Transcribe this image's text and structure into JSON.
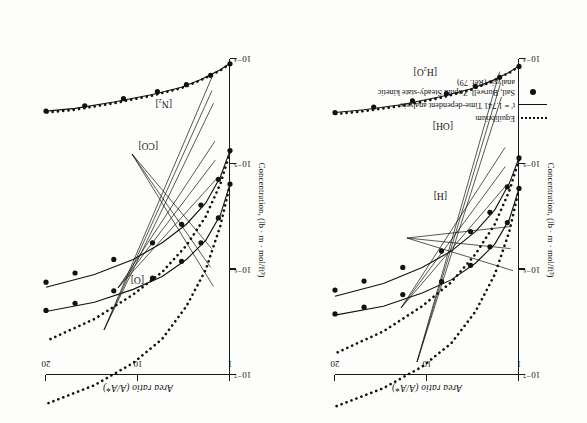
{
  "figure": {
    "orientation_note": "rotated-180",
    "axis_top_title": "Area ratio (A/A*)",
    "axis_side_title": "Concentration, (lb · m · mol/ft³)",
    "area_ticks": [
      "1",
      "10",
      "20"
    ],
    "conc_ticks": [
      "10⁻⁷",
      "10⁻⁶",
      "10⁻⁵",
      "10⁻⁴"
    ]
  },
  "legend": {
    "items": [
      {
        "key": "dotted-line",
        "label": "Equilibrium"
      },
      {
        "key": "solid-line",
        "label": "t' = 1.741 Time-dependent analysis"
      },
      {
        "key": "dot-marker",
        "label": "Satl, Burwell, Zupnik Steady-state kinetic analysis (Ref. 79)"
      }
    ]
  },
  "panels": [
    {
      "id": "left",
      "species_labels": [
        "[H]",
        "[OH]",
        "[H₂O]"
      ]
    },
    {
      "id": "right",
      "species_labels": [
        "[O]",
        "[CO]",
        "[N₂]"
      ]
    }
  ],
  "chart_data": {
    "type": "line",
    "xlabel": "Area ratio (A/A*)",
    "ylabel": "Concentration, (lb · m · mol/ft³)",
    "xlim": [
      1,
      20
    ],
    "xticks": [
      1,
      10,
      20
    ],
    "ylim": [
      1e-07,
      0.0001
    ],
    "yscale": "log",
    "yticks": [
      1e-07,
      1e-06,
      1e-05,
      0.0001
    ],
    "grid": false,
    "legend_position": "lower-left",
    "panels": [
      {
        "panel": "left",
        "series": [
          {
            "name": "[H₂O] equilibrium",
            "style": "dotted",
            "x": [
              1,
              2,
              4,
              6,
              9,
              13,
              17,
              20
            ],
            "y": [
              8.5e-05,
              7.4e-05,
              6e-05,
              5.1e-05,
              4.3e-05,
              3.6e-05,
              3.2e-05,
              3e-05
            ]
          },
          {
            "name": "[H₂O] time-dependent",
            "style": "solid",
            "x": [
              1,
              2,
              4,
              6,
              9,
              13,
              17,
              20
            ],
            "y": [
              8.6e-05,
              7.5e-05,
              6.1e-05,
              5.2e-05,
              4.4e-05,
              3.7e-05,
              3.3e-05,
              3.1e-05
            ]
          },
          {
            "name": "[H₂O] steady-state kinetic (Ref. 79)",
            "style": "markers",
            "x": [
              1,
              3,
              5.5,
              8.5,
              12,
              16,
              20
            ],
            "y": [
              8.5e-05,
              6.7e-05,
              5.5e-05,
              4.7e-05,
              4e-05,
              3.5e-05,
              3.1e-05
            ]
          },
          {
            "name": "[OH] equilibrium",
            "style": "dotted",
            "x": [
              1,
              2,
              3.5,
              5.5,
              8,
              11,
              15,
              20
            ],
            "y": [
              1.1e-05,
              5.6e-06,
              2.7e-06,
              1.4e-06,
              7.6e-07,
              4.5e-07,
              2.6e-07,
              1.6e-07
            ]
          },
          {
            "name": "[OH] time-dependent",
            "style": "solid",
            "x": [
              1,
              2,
              3.5,
              5.5,
              8,
              11,
              15,
              20
            ],
            "y": [
              1.15e-05,
              6.6e-06,
              3.7e-06,
              2.3e-06,
              1.5e-06,
              1.05e-06,
              7.4e-07,
              5.6e-07
            ]
          },
          {
            "name": "[OH] steady-state kinetic (Ref. 79)",
            "style": "markers",
            "x": [
              1,
              2.2,
              4,
              6,
              9,
              13,
              17,
              20
            ],
            "y": [
              1.15e-05,
              6.1e-06,
              3.5e-06,
              2.3e-06,
              1.5e-06,
              1.05e-06,
              7.8e-07,
              6.4e-07
            ]
          },
          {
            "name": "[H] equilibrium",
            "style": "dotted",
            "x": [
              1,
              2,
              3.5,
              5.5,
              8,
              11,
              15,
              20
            ],
            "y": [
              5.8e-06,
              2.3e-06,
              9e-07,
              4e-07,
              2e-07,
              1.2e-07,
              7.5e-08,
              5e-08
            ]
          },
          {
            "name": "[H] time-dependent",
            "style": "solid",
            "x": [
              1,
              2,
              3.5,
              5.5,
              8,
              11,
              15,
              20
            ],
            "y": [
              5.9e-06,
              3e-06,
              1.75e-06,
              1.15e-06,
              8e-07,
              6e-07,
              4.5e-07,
              3.7e-07
            ]
          },
          {
            "name": "[H] steady-state kinetic (Ref. 79)",
            "style": "markers",
            "x": [
              1,
              2.2,
              4,
              6,
              9,
              13,
              17,
              20
            ],
            "y": [
              5.9e-06,
              2.8e-06,
              1.65e-06,
              1.1e-06,
              7.7e-07,
              5.8e-07,
              4.4e-07,
              3.8e-07
            ]
          }
        ]
      },
      {
        "panel": "right",
        "series": [
          {
            "name": "[N₂] equilibrium",
            "style": "dotted",
            "x": [
              1,
              2,
              4,
              6,
              9,
              13,
              17,
              20
            ],
            "y": [
              9e-05,
              7.8e-05,
              6.3e-05,
              5.3e-05,
              4.5e-05,
              3.8e-05,
              3.3e-05,
              3.1e-05
            ]
          },
          {
            "name": "[N₂] time-dependent",
            "style": "solid",
            "x": [
              1,
              2,
              4,
              6,
              9,
              13,
              17,
              20
            ],
            "y": [
              9.1e-05,
              7.9e-05,
              6.4e-05,
              5.4e-05,
              4.6e-05,
              3.9e-05,
              3.4e-05,
              3.2e-05
            ]
          },
          {
            "name": "[N₂] steady-state kinetic (Ref. 79)",
            "style": "markers",
            "x": [
              1,
              3,
              5.5,
              8.5,
              12,
              16,
              20
            ],
            "y": [
              9e-05,
              7e-05,
              5.7e-05,
              4.9e-05,
              4.2e-05,
              3.6e-05,
              3.2e-05
            ]
          },
          {
            "name": "[CO] equilibrium",
            "style": "dotted",
            "x": [
              1,
              2,
              3.5,
              5.5,
              8,
              11,
              15,
              20
            ],
            "y": [
              1.3e-05,
              6.5e-06,
              3.2e-06,
              1.7e-06,
              9.5e-07,
              5.8e-07,
              3.4e-07,
              2.1e-07
            ]
          },
          {
            "name": "[CO] time-dependent",
            "style": "solid",
            "x": [
              1,
              2,
              3.5,
              5.5,
              8,
              11,
              15,
              20
            ],
            "y": [
              1.35e-05,
              7.6e-06,
              4.3e-06,
              2.7e-06,
              1.8e-06,
              1.25e-06,
              9e-07,
              6.8e-07
            ]
          },
          {
            "name": "[CO] steady-state kinetic (Ref. 79)",
            "style": "markers",
            "x": [
              1,
              2.2,
              4,
              6,
              9,
              13,
              17,
              20
            ],
            "y": [
              1.35e-05,
              7.2e-06,
              4.1e-06,
              2.7e-06,
              1.8e-06,
              1.25e-06,
              9.3e-07,
              7.6e-07
            ]
          },
          {
            "name": "[O] equilibrium",
            "style": "dotted",
            "x": [
              1,
              2,
              3.5,
              5.5,
              8,
              11,
              15,
              20
            ],
            "y": [
              6.4e-06,
              2.6e-06,
              1e-06,
              4.5e-07,
              2.2e-07,
              1.3e-07,
              8e-08,
              5.3e-08
            ]
          },
          {
            "name": "[O] time-dependent",
            "style": "solid",
            "x": [
              1,
              2,
              3.5,
              5.5,
              8,
              11,
              15,
              20
            ],
            "y": [
              6.5e-06,
              3.3e-06,
              1.9e-06,
              1.25e-06,
              8.6e-07,
              6.5e-07,
              4.9e-07,
              4e-07
            ]
          },
          {
            "name": "[O] steady-state kinetic (Ref. 79)",
            "style": "markers",
            "x": [
              1,
              2.2,
              4,
              6,
              9,
              13,
              17,
              20
            ],
            "y": [
              6.5e-06,
              3.1e-06,
              1.8e-06,
              1.2e-06,
              8.3e-07,
              6.3e-07,
              4.8e-07,
              4.1e-07
            ]
          }
        ]
      }
    ]
  }
}
